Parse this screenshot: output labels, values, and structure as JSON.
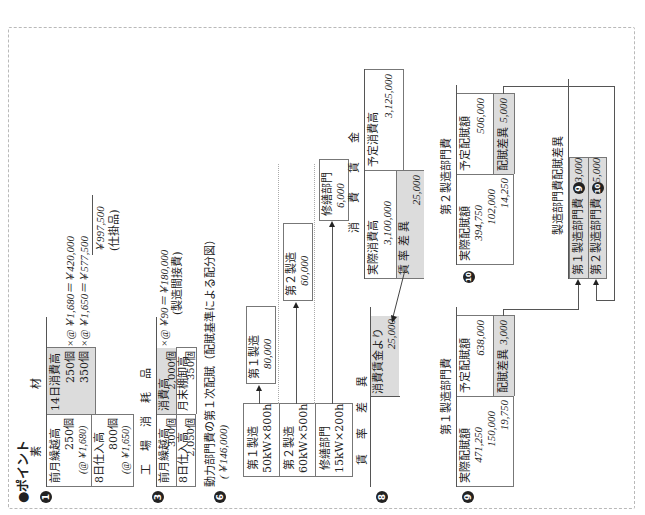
{
  "heading": "●ポイント",
  "s1": {
    "num": "1",
    "title_left": "素",
    "title_right": "材",
    "debit": [
      {
        "label": "前月繰越高",
        "qty": "250個",
        "price": "(@￥1,680)"
      },
      {
        "label": "8日仕入高",
        "qty": "800個",
        "price": "(@￥1,650)"
      }
    ],
    "credit_label": "14日消費高",
    "credit_rows": [
      "250個",
      "350個"
    ],
    "calc": [
      "×@￥1,680＝￥420,000",
      "×@￥1,650＝￥577,500"
    ],
    "total": "￥997,500",
    "total_note": "(仕掛品)"
  },
  "s3": {
    "num": "3",
    "title": "工　場　消　耗　品",
    "debit": [
      {
        "label": "前月繰越高",
        "qty": "300個"
      },
      {
        "label": "8日仕入高",
        "qty": "2,050個"
      }
    ],
    "credit": [
      {
        "label": "消費高",
        "qty": "2,000個"
      },
      {
        "label": "月末棚卸高",
        "qty": "350個"
      }
    ],
    "calc": "×@￥90＝￥180,000",
    "calc_note": "(製造間接費)"
  },
  "s6": {
    "num": "6",
    "title": "動力部門費の第１次配賦（配賦基準による配分図）",
    "subtitle": "(￥146,000)",
    "bases": [
      {
        "dept": "第１製造",
        "basis": "50kW×800h"
      },
      {
        "dept": "第２製造",
        "basis": "60kW×500h"
      },
      {
        "dept": "修繕部門",
        "basis": "15kW×200h"
      }
    ],
    "results": [
      {
        "dept": "第１製造",
        "amount": "80,000"
      },
      {
        "dept": "第２製造",
        "amount": "60,000"
      },
      {
        "dept": "修繕部門",
        "amount": "6,000"
      }
    ]
  },
  "s8": {
    "num": "8",
    "rate_var_title": "賃　率　差　異",
    "rate_var_entry": "消費賃金より",
    "rate_var_amount": "25,000",
    "wages_title": "消　費　賃　金",
    "actual_label": "実際消費高",
    "actual_amount": "3,100,000",
    "variance_label": "賃 率 差 異",
    "variance_amount": "25,000",
    "planned_label": "予定消費高",
    "planned_amount": "3,125,000"
  },
  "s9": {
    "num": "9",
    "title": "第１製造部門費",
    "actual_label": "実際配賦額",
    "actual_values": [
      "471,250",
      "150,000",
      "19,750"
    ],
    "planned_label": "予定配賦額",
    "planned_amount": "638,000",
    "variance_label": "配賦差異",
    "variance_amount": "3,000"
  },
  "s10": {
    "num": "10",
    "title": "第２製造部門費",
    "actual_label": "実際配賦額",
    "actual_values": [
      "394,750",
      "102,000",
      "14,250"
    ],
    "planned_label": "予定配賦額",
    "planned_amount": "506,000",
    "variance_label": "配賦差異",
    "variance_amount": "5,000"
  },
  "summary": {
    "title": "製造部門費配賦差異",
    "rows": [
      {
        "label": "第１製造部門費",
        "ref": "9",
        "amount": "3,000"
      },
      {
        "label": "第２製造部門費",
        "ref": "10",
        "amount": "5,000"
      }
    ]
  }
}
